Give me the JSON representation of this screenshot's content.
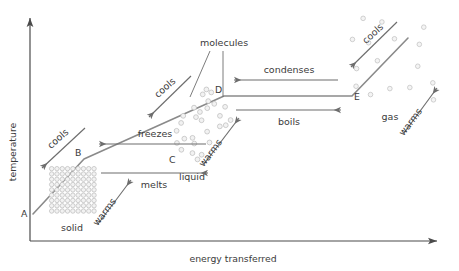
{
  "figure": {
    "axes": {
      "y_label": "temperature",
      "x_label": "energy transferred"
    },
    "points": [
      {
        "id": "A",
        "label": "A",
        "x": 33,
        "y": 214
      },
      {
        "id": "B",
        "label": "B",
        "x": 84,
        "y": 159
      },
      {
        "id": "C",
        "label": "C",
        "x": 169,
        "y": 159
      },
      {
        "id": "D",
        "label": "D",
        "x": 224,
        "y": 96
      },
      {
        "id": "E",
        "label": "E",
        "x": 352,
        "y": 96
      }
    ],
    "curve_path": "M 33,214 L 84,159 L 224,96 L 352,96 L 408,38",
    "state_labels": [
      {
        "id": "solid",
        "label": "solid",
        "x": 72,
        "y": 228
      },
      {
        "id": "liquid",
        "label": "liquid",
        "x": 190,
        "y": 177
      },
      {
        "id": "gas",
        "label": "gas",
        "x": 388,
        "y": 117
      },
      {
        "id": "molecules",
        "label": "molecules",
        "x": 224,
        "y": 48
      }
    ],
    "sloped_arrows": [
      {
        "id": "solid-cools",
        "label": "cools",
        "x1": 85,
        "y1": 128,
        "x2": 42,
        "y2": 168,
        "angle": -42
      },
      {
        "id": "solid-warms",
        "label": "warms",
        "x1": 98,
        "y1": 224,
        "x2": 130,
        "y2": 180,
        "angle": -52
      },
      {
        "id": "liquid-cools",
        "label": "cools",
        "x1": 191,
        "y1": 76,
        "x2": 149,
        "y2": 117,
        "angle": -42
      },
      {
        "id": "liquid-warms",
        "label": "warms",
        "x1": 204,
        "y1": 164,
        "x2": 239,
        "y2": 118,
        "angle": -52
      },
      {
        "id": "gas-cools",
        "label": "cools",
        "x1": 397,
        "y1": 22,
        "x2": 351,
        "y2": 67,
        "angle": -43
      },
      {
        "id": "gas-warms",
        "label": "warms",
        "x1": 404,
        "y1": 133,
        "x2": 436,
        "y2": 88,
        "angle": -54
      }
    ],
    "phase_change_arrows": [
      {
        "id": "freezes",
        "label": "freezes",
        "x1": 206,
        "y1": 143,
        "x2": 98,
        "y2": 143,
        "direction": "left",
        "label_x": 152,
        "label_y": 136
      },
      {
        "id": "melts",
        "label": "melts",
        "x1": 102,
        "y1": 172,
        "x2": 208,
        "y2": 172,
        "direction": "right",
        "label_x": 155,
        "label_y": 186
      },
      {
        "id": "condenses",
        "label": "condenses",
        "x1": 337,
        "y1": 79,
        "x2": 233,
        "y2": 79,
        "direction": "left",
        "label_x": 287,
        "label_y": 72
      },
      {
        "id": "boils",
        "label": "boils",
        "x1": 237,
        "y1": 109,
        "x2": 340,
        "y2": 109,
        "direction": "right",
        "label_x": 288,
        "label_y": 123
      }
    ],
    "molecule_groups": {
      "solid": {
        "type": "lattice",
        "x": 49,
        "y": 166,
        "width": 47,
        "height": 47,
        "spacing": 5.3,
        "radius": 2.2,
        "count_note": "dense regular packed grid"
      },
      "liquid": {
        "type": "cluster",
        "radius": 2.4,
        "count_note": "loose random cluster between C and D"
      },
      "gas": {
        "type": "scattered",
        "radius": 2.3,
        "count_note": "widely spaced scattered circles beyond E"
      }
    }
  }
}
